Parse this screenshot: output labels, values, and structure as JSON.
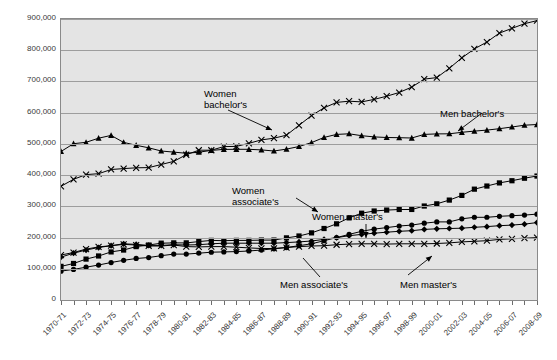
{
  "chart_data": {
    "type": "line",
    "title": "",
    "xlabel": "",
    "ylabel": "",
    "ylim": [
      0,
      900000
    ],
    "ytick_labels": [
      "900,000",
      "800,000",
      "700,000",
      "600,000",
      "500,000",
      "400,000",
      "300,000",
      "200,000",
      "100,000",
      "0"
    ],
    "ytick_values": [
      900000,
      800000,
      700000,
      600000,
      500000,
      400000,
      300000,
      200000,
      100000,
      0
    ],
    "grid": true,
    "legend_position": "annotations-inline",
    "x": [
      "1970-71",
      "1971-72",
      "1972-73",
      "1973-74",
      "1974-75",
      "1975-76",
      "1976-77",
      "1977-78",
      "1978-79",
      "1979-80",
      "1980-81",
      "1981-82",
      "1982-83",
      "1983-84",
      "1984-85",
      "1985-86",
      "1986-87",
      "1987-88",
      "1988-89",
      "1989-90",
      "1990-91",
      "1991-92",
      "1992-93",
      "1993-94",
      "1994-95",
      "1995-96",
      "1996-97",
      "1997-98",
      "1998-99",
      "1999-00",
      "2000-01",
      "2001-02",
      "2002-03",
      "2003-04",
      "2004-05",
      "2005-06",
      "2006-07",
      "2007-08",
      "2008-09"
    ],
    "xtick_labels": [
      "1970-71",
      "1972-73",
      "1974-75",
      "1976-77",
      "1978-79",
      "1980-81",
      "1982-83",
      "1984-85",
      "1986-87",
      "1988-89",
      "1990-91",
      "1992-93",
      "1994-95",
      "1996-97",
      "1998-99",
      "2000-01",
      "2002-03",
      "2004-05",
      "2006-07",
      "2008-09"
    ],
    "series": [
      {
        "name": "Men bachelor's",
        "marker": "triangle",
        "values": [
          475594,
          500590,
          505000,
          518191,
          527313,
          504841,
          495545,
          487347,
          477344,
          473611,
          469883,
          473364,
          479140,
          482319,
          482528,
          482528,
          480782,
          477203,
          483346,
          491696,
          504045,
          520811,
          530341,
          532422,
          526131,
          522438,
          520515,
          519956,
          518746,
          530367,
          531840,
          532445,
          537011,
          540897,
          544200,
          548500,
          554100,
          560000,
          562000
        ]
      },
      {
        "name": "Women bachelor's",
        "marker": "cross",
        "values": [
          364136,
          386683,
          401509,
          404613,
          418092,
          420821,
          423476,
          424004,
          433857,
          443989,
          465257,
          479634,
          479634,
          491259,
          491990,
          501900,
          512645,
          518140,
          527776,
          559648,
          590493,
          615505,
          632748,
          636617,
          634424,
          642338,
          652844,
          664450,
          682046,
          707508,
          712331,
          742084,
          775424,
          804117,
          826264,
          855000,
          870000,
          885000,
          895000
        ]
      },
      {
        "name": "Women associate's",
        "marker": "square",
        "values": [
          107741,
          117000,
          131000,
          141000,
          154000,
          160000,
          171000,
          176000,
          182000,
          183000,
          183000,
          187000,
          191000,
          190000,
          191000,
          191000,
          192000,
          192000,
          199000,
          205000,
          215000,
          229000,
          244000,
          263000,
          278000,
          285000,
          288000,
          290000,
          290000,
          301000,
          308000,
          320000,
          335000,
          355000,
          365000,
          375000,
          382000,
          390000,
          397000
        ]
      },
      {
        "name": "Women master's",
        "marker": "circle",
        "values": [
          92481,
          98000,
          105000,
          112000,
          120000,
          127000,
          133000,
          136000,
          142000,
          147000,
          147000,
          150000,
          153000,
          154000,
          155000,
          157000,
          160000,
          164000,
          168000,
          174000,
          180000,
          190000,
          200000,
          210000,
          220000,
          227000,
          232000,
          237000,
          240000,
          246000,
          250000,
          250000,
          260000,
          265000,
          265000,
          268000,
          270000,
          272000,
          275000
        ]
      },
      {
        "name": "Men master's",
        "marker": "diamond",
        "values": [
          137434,
          150000,
          160000,
          168000,
          174000,
          180000,
          178000,
          175000,
          175000,
          177000,
          176000,
          177000,
          180000,
          182000,
          182000,
          182000,
          182000,
          182000,
          184000,
          186000,
          189000,
          194000,
          200000,
          206000,
          210000,
          214000,
          217000,
          220000,
          222000,
          226000,
          228000,
          229000,
          230000,
          233000,
          235000,
          238000,
          240000,
          243000,
          248000
        ]
      },
      {
        "name": "Men associate's",
        "marker": "cross",
        "values": [
          144000,
          152000,
          163000,
          170000,
          174000,
          178000,
          176000,
          173000,
          173000,
          176000,
          171000,
          170000,
          171000,
          171000,
          169000,
          167000,
          165000,
          165000,
          168000,
          171000,
          173000,
          174000,
          177000,
          179000,
          180000,
          180000,
          179000,
          180000,
          180000,
          180000,
          181000,
          183000,
          186000,
          188000,
          190000,
          194000,
          196000,
          198000,
          200000
        ]
      }
    ]
  },
  "annotations": [
    {
      "id": "women-bachelors",
      "text_lines": [
        "Women",
        "bachelor's"
      ]
    },
    {
      "id": "men-bachelors",
      "text_lines": [
        "Men bachelor's"
      ]
    },
    {
      "id": "women-associates",
      "text_lines": [
        "Women",
        "associate's"
      ]
    },
    {
      "id": "women-masters",
      "text_lines": [
        "Women master's"
      ]
    },
    {
      "id": "men-associates",
      "text_lines": [
        "Men associate's"
      ]
    },
    {
      "id": "men-masters",
      "text_lines": [
        "Men master's"
      ]
    }
  ],
  "annotation_text": {
    "women_bachelors_l1": "Women",
    "women_bachelors_l2": "bachelor's",
    "men_bachelors": "Men bachelor's",
    "women_associates_l1": "Women",
    "women_associates_l2": "associate's",
    "women_masters": "Women master's",
    "men_associates": "Men associate's",
    "men_masters": "Men master's"
  }
}
